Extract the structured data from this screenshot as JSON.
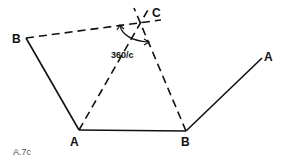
{
  "diagram": {
    "caption": "A.7c",
    "angle_label": "360/c",
    "colors": {
      "line": "#111111",
      "caption": "#555555",
      "background": "#ffffff"
    },
    "points": {
      "B_left": {
        "label": "B",
        "x": 26,
        "y": 38
      },
      "A_bottom": {
        "label": "A",
        "x": 79,
        "y": 130
      },
      "B_bottom": {
        "label": "B",
        "x": 186,
        "y": 131
      },
      "A_right": {
        "label": "A",
        "x": 262,
        "y": 58
      },
      "C_center": {
        "label": "C",
        "x": 141,
        "y": 23
      }
    },
    "labels": {
      "B_left": "B",
      "A_bottom": "A",
      "B_bottom": "B",
      "A_right": "A",
      "C": "C"
    },
    "edges_solid": [
      [
        "B_left",
        "A_bottom"
      ],
      [
        "A_bottom",
        "B_bottom"
      ],
      [
        "B_bottom",
        "A_right"
      ]
    ],
    "edges_dashed": [
      [
        "B_left",
        "C_center"
      ],
      [
        "A_bottom",
        "C_center"
      ],
      [
        "B_bottom",
        "C_center"
      ]
    ]
  }
}
